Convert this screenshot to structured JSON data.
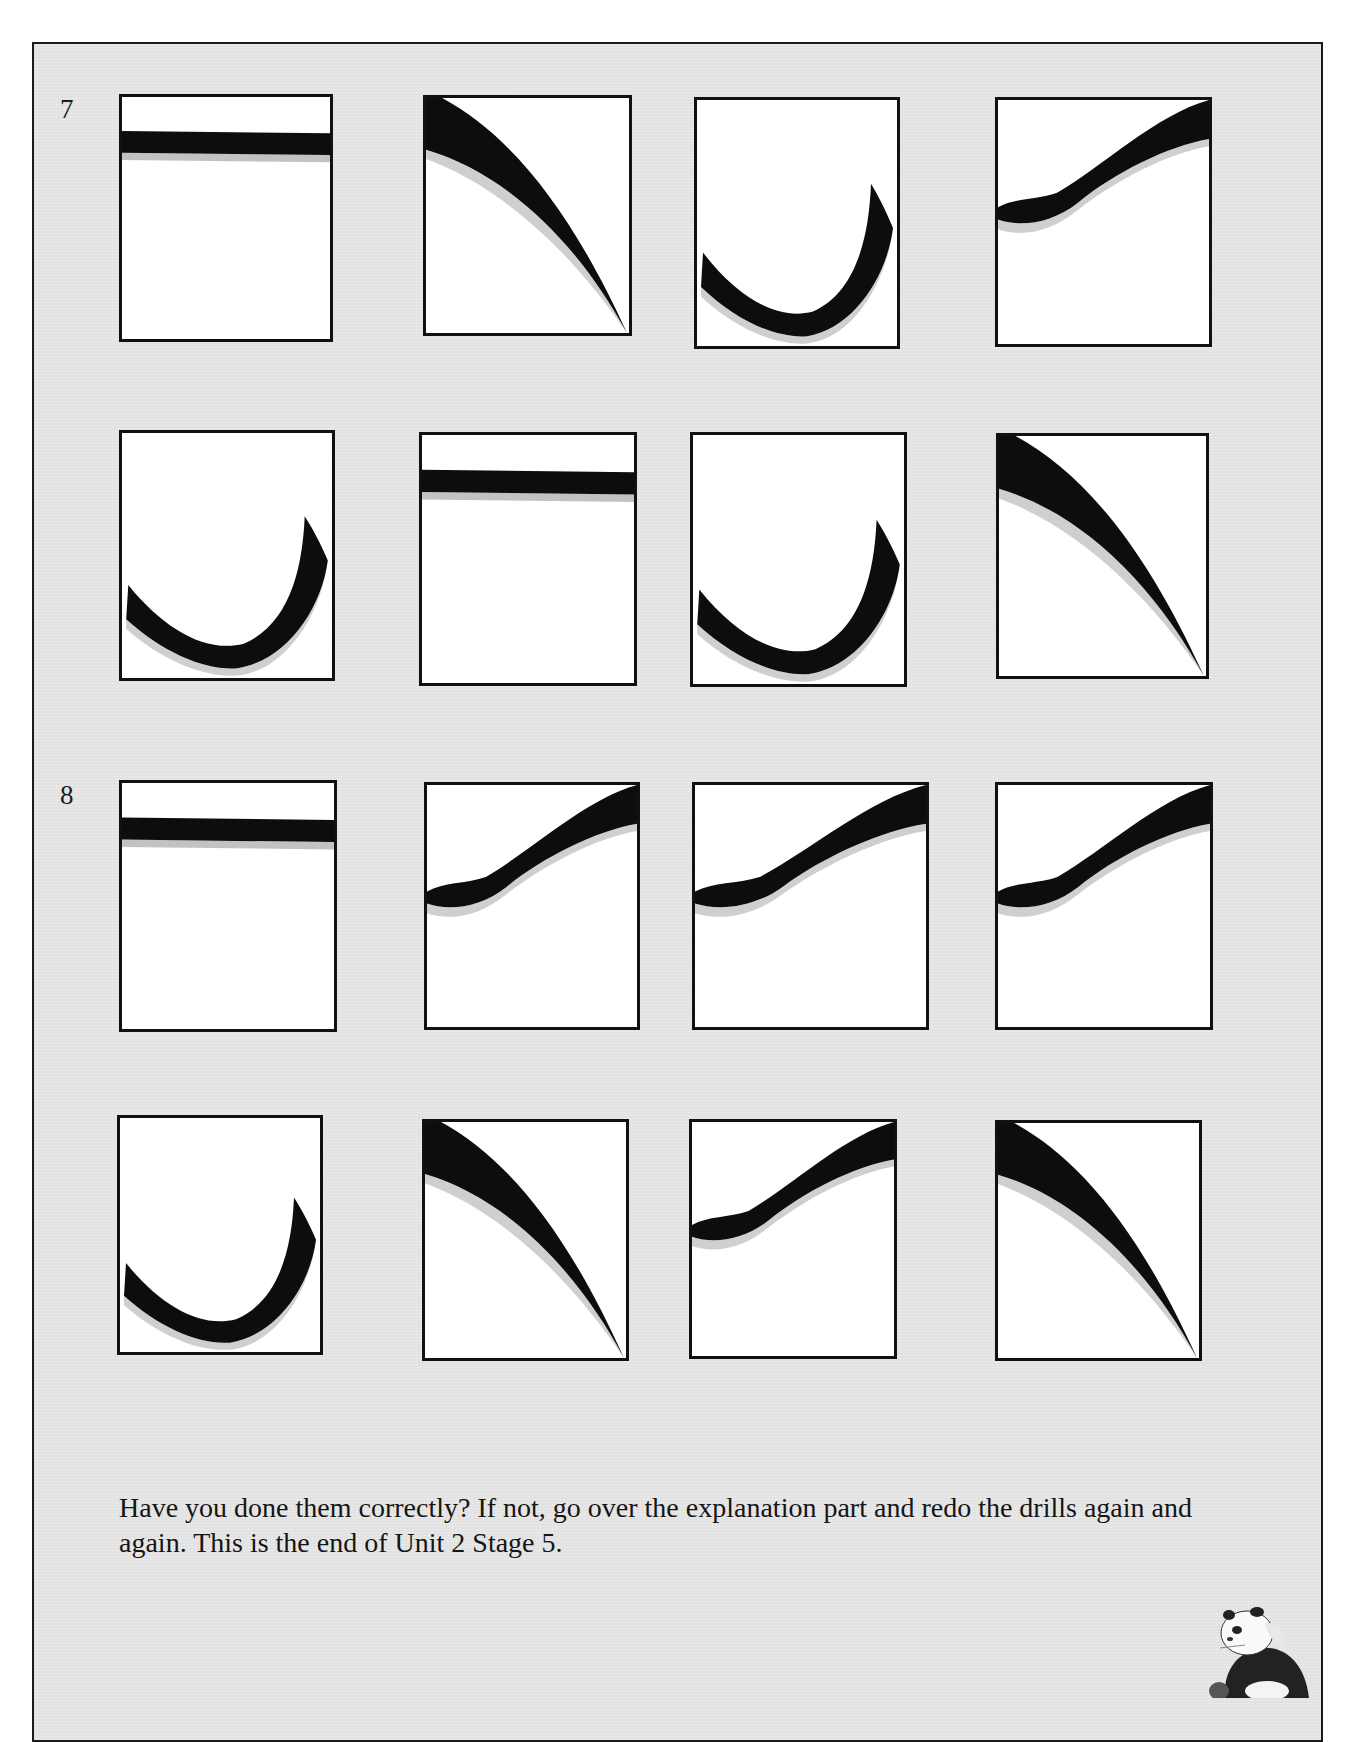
{
  "page": {
    "background_color": "#e4e4e4",
    "card_color": "#ffffff",
    "ink_color": "#0d0d0d"
  },
  "groups": [
    {
      "number": "7",
      "cards": [
        {
          "stroke": "horizontal"
        },
        {
          "stroke": "left-falling"
        },
        {
          "stroke": "curved-hook"
        },
        {
          "stroke": "rising-wave"
        },
        {
          "stroke": "curved-hook"
        },
        {
          "stroke": "horizontal"
        },
        {
          "stroke": "curved-hook"
        },
        {
          "stroke": "left-falling"
        }
      ]
    },
    {
      "number": "8",
      "cards": [
        {
          "stroke": "horizontal"
        },
        {
          "stroke": "rising-wave"
        },
        {
          "stroke": "rising-wave"
        },
        {
          "stroke": "rising-wave"
        },
        {
          "stroke": "curved-hook"
        },
        {
          "stroke": "left-falling"
        },
        {
          "stroke": "rising-wave"
        },
        {
          "stroke": "left-falling"
        }
      ]
    }
  ],
  "closing": {
    "text": "Have you done them correctly?  If not, go over the explanation part and redo the drills again and again.  This is the end of Unit 2 Stage 5."
  },
  "mascot": {
    "icon": "panda-icon"
  }
}
